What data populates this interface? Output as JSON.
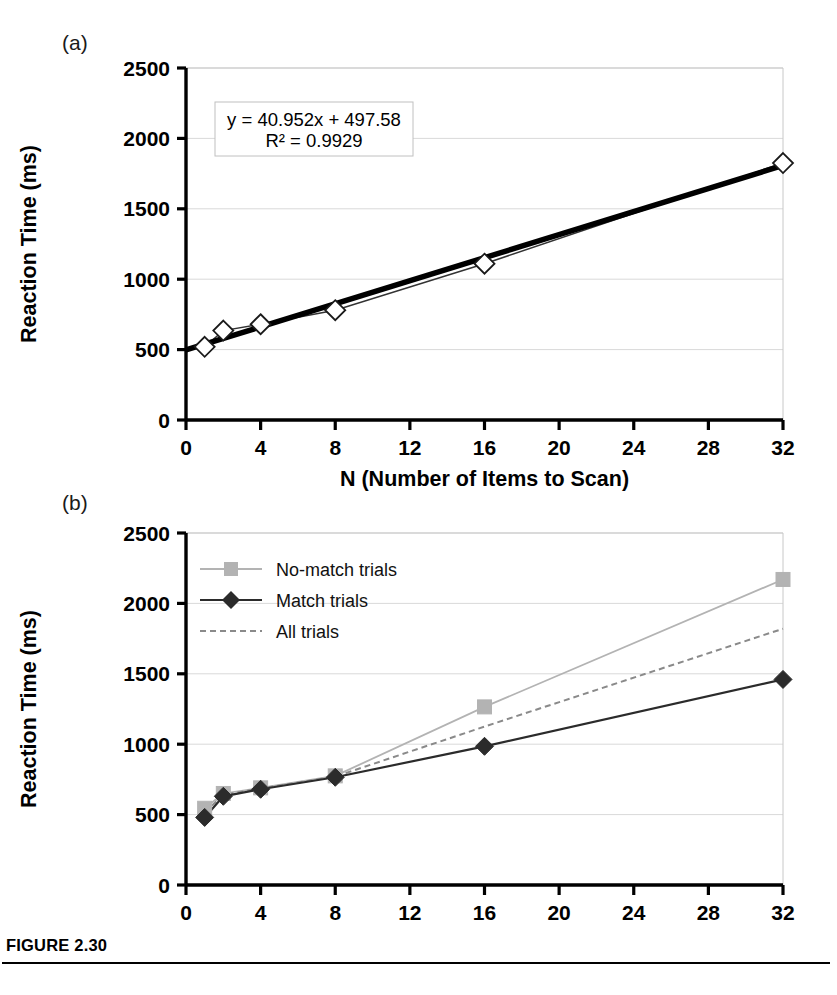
{
  "figure": {
    "caption_label": "FIGURE 2.30",
    "panel_a_label": "(a)",
    "panel_b_label": "(b)"
  },
  "colors": {
    "axis": "#000000",
    "gridline": "#d9d9d9",
    "plot_border": "#c8c8c8",
    "no_match": "#b3b3b3",
    "match": "#2b2b2b",
    "all_trials": "#8a8a8a",
    "trend_line": "#000000",
    "marker_fill_open": "#ffffff",
    "equation_box_border": "#c0c0c0",
    "equation_box_fill": "#ffffff"
  },
  "chart_data": [
    {
      "id": "panel-a",
      "type": "line",
      "title": "",
      "panel": "(a)",
      "xlabel": "N (Number of Items to Scan)",
      "ylabel": "Reaction Time (ms)",
      "xlim": [
        0,
        32
      ],
      "ylim": [
        0,
        2500
      ],
      "xticks": [
        0,
        4,
        8,
        12,
        16,
        20,
        24,
        28,
        32
      ],
      "yticks": [
        0,
        500,
        1000,
        1500,
        2000,
        2500
      ],
      "grid": true,
      "legend": "none",
      "annotations": [
        "y = 40.952x + 497.58",
        "R² = 0.9929"
      ],
      "annotation_lines": {
        "equation": "y = 40.952x + 497.58",
        "r_squared": "R² = 0.9929"
      },
      "series": [
        {
          "name": "All trials",
          "marker": "open-diamond",
          "x": [
            1,
            2,
            4,
            8,
            16,
            32
          ],
          "values": [
            520,
            635,
            680,
            780,
            1110,
            1825
          ]
        },
        {
          "name": "Linear trend",
          "marker": "none",
          "style": "thick-solid",
          "slope": 40.952,
          "intercept": 497.58,
          "x": [
            0,
            32
          ],
          "values": [
            497.58,
            1808.0
          ]
        }
      ]
    },
    {
      "id": "panel-b",
      "type": "line",
      "title": "",
      "panel": "(b)",
      "xlabel": "N (Number of Items to Scan)",
      "ylabel": "Reaction Time (ms)",
      "xlim": [
        0,
        32
      ],
      "ylim": [
        0,
        2500
      ],
      "xticks": [
        0,
        4,
        8,
        12,
        16,
        20,
        24,
        28,
        32
      ],
      "yticks": [
        0,
        500,
        1000,
        1500,
        2000,
        2500
      ],
      "grid": true,
      "legend": "upper-left",
      "legend_entries": [
        {
          "label": "No-match trials",
          "marker": "square",
          "style": "solid-light"
        },
        {
          "label": "Match trials",
          "marker": "diamond",
          "style": "solid-dark"
        },
        {
          "label": "All trials",
          "marker": "none",
          "style": "dashed"
        }
      ],
      "x": [
        1,
        2,
        4,
        8,
        16,
        32
      ],
      "series": [
        {
          "name": "No-match trials",
          "marker": "square",
          "values": [
            545,
            650,
            690,
            775,
            1265,
            2170
          ]
        },
        {
          "name": "Match trials",
          "marker": "diamond",
          "values": [
            480,
            630,
            680,
            765,
            985,
            1460
          ]
        },
        {
          "name": "All trials",
          "marker": "none",
          "values": [
            515,
            640,
            685,
            770,
            1125,
            1820
          ]
        }
      ]
    }
  ]
}
